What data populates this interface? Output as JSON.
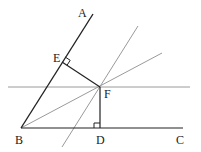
{
  "diagram": {
    "type": "geometry",
    "labels": {
      "A": "A",
      "B": "B",
      "C": "C",
      "D": "D",
      "E": "E",
      "F": "F"
    },
    "points": {
      "A": [
        93,
        14
      ],
      "B": [
        21,
        128
      ],
      "C": [
        183,
        128
      ],
      "D": [
        100,
        128
      ],
      "E": [
        62,
        62
      ],
      "F": [
        100,
        87
      ]
    },
    "segments": [
      {
        "name": "BA",
        "from": "B",
        "to": "A",
        "color": "#222222"
      },
      {
        "name": "BC",
        "from": "B",
        "to": "C",
        "color": "#222222"
      },
      {
        "name": "EF",
        "from": "E",
        "to": "F",
        "color": "#222222"
      },
      {
        "name": "FD",
        "from": "F",
        "to": "D",
        "color": "#222222"
      }
    ],
    "auxiliary_lines": [
      {
        "name": "horizontal-through-F",
        "color": "#999999"
      },
      {
        "name": "bisector-BF",
        "color": "#999999"
      },
      {
        "name": "parallel-to-BA-through-F",
        "color": "#999999"
      }
    ],
    "right_angles": [
      "E",
      "D"
    ]
  }
}
